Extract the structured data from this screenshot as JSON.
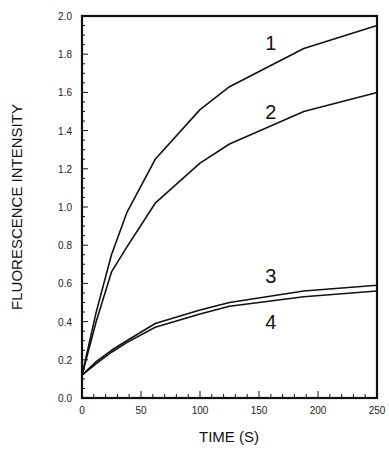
{
  "chart_data": {
    "type": "line",
    "title": "",
    "xlabel": "TIME (S)",
    "ylabel": "FLUORESCENCE INTENSITY",
    "xlim": [
      0,
      250
    ],
    "ylim": [
      0.0,
      2.0
    ],
    "grid": false,
    "legend_position": "inline labels",
    "x_ticks": [
      0,
      50,
      100,
      150,
      200,
      250
    ],
    "x_tick_labels": [
      "0",
      "50",
      "100",
      "150",
      "200",
      "250"
    ],
    "y_ticks": [
      0.0,
      0.2,
      0.4,
      0.6,
      0.8,
      1.0,
      1.2,
      1.4,
      1.6,
      1.8,
      2.0
    ],
    "y_tick_labels": [
      "0.0",
      "0.2",
      "0.4",
      "0.6",
      "0.8",
      "1.0",
      "1.2",
      "1.4",
      "1.6",
      "1.8",
      "2.0"
    ],
    "x": [
      0,
      12,
      25,
      38,
      62,
      100,
      125,
      188,
      250
    ],
    "series": [
      {
        "name": "1",
        "values": [
          0.12,
          0.45,
          0.75,
          0.97,
          1.25,
          1.51,
          1.63,
          1.83,
          1.95
        ]
      },
      {
        "name": "2",
        "values": [
          0.12,
          0.4,
          0.66,
          0.79,
          1.02,
          1.23,
          1.33,
          1.5,
          1.6
        ]
      },
      {
        "name": "3",
        "values": [
          0.12,
          0.19,
          0.25,
          0.3,
          0.39,
          0.46,
          0.5,
          0.56,
          0.59
        ]
      },
      {
        "name": "4",
        "values": [
          0.12,
          0.18,
          0.24,
          0.29,
          0.37,
          0.44,
          0.48,
          0.53,
          0.56
        ]
      }
    ],
    "annotations": [
      {
        "text": "1",
        "x": 160,
        "y": 1.86
      },
      {
        "text": "2",
        "x": 160,
        "y": 1.5
      },
      {
        "text": "3",
        "x": 160,
        "y": 0.64
      },
      {
        "text": "4",
        "x": 160,
        "y": 0.4
      }
    ]
  },
  "colors": {
    "line": "#111111",
    "background": "#ffffff"
  }
}
